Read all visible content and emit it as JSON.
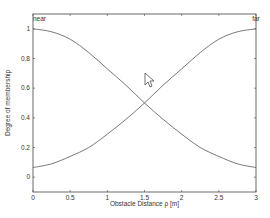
{
  "chart_data": {
    "type": "line",
    "title": "",
    "xlabel": "Obstacle Distance ρ [m]",
    "ylabel": "Degree of membership",
    "xlim": [
      0,
      3
    ],
    "ylim": [
      -0.1,
      1.1
    ],
    "x_ticks": [
      "0",
      "0.5",
      "1",
      "1.5",
      "2",
      "2.5",
      "3"
    ],
    "y_ticks": [
      "0",
      "0.2",
      "0.4",
      "0.6",
      "0.8",
      "1"
    ],
    "grid": false,
    "annotations": [
      {
        "text": "near",
        "x": 0,
        "y": 1.1
      },
      {
        "text": "far",
        "x": 3,
        "y": 1.1
      }
    ],
    "x": [
      0,
      0.25,
      0.5,
      0.75,
      1.0,
      1.25,
      1.5,
      1.75,
      2.0,
      2.25,
      2.5,
      2.75,
      3.0
    ],
    "series": [
      {
        "name": "near",
        "values": [
          1.0,
          0.98,
          0.93,
          0.84,
          0.73,
          0.62,
          0.5,
          0.39,
          0.29,
          0.2,
          0.14,
          0.09,
          0.065
        ]
      },
      {
        "name": "far",
        "values": [
          0.065,
          0.09,
          0.14,
          0.2,
          0.29,
          0.39,
          0.5,
          0.62,
          0.73,
          0.84,
          0.93,
          0.98,
          1.0
        ]
      }
    ],
    "line_color": "#555555"
  }
}
